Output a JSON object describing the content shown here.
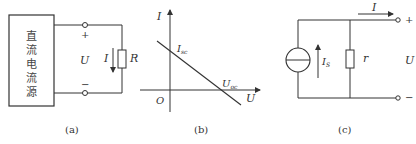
{
  "figure_a": {
    "caption": "(a)",
    "source_box_chars": [
      "直",
      "流",
      "电",
      "流",
      "源"
    ],
    "plus_label": "+",
    "minus_label": "−",
    "voltage_label": "U",
    "current_label": "I",
    "resistor_label": "R"
  },
  "figure_b": {
    "caption": "(b)",
    "y_axis_label": "I",
    "x_axis_label": "U",
    "origin_label": "O",
    "y_intercept_label": "I",
    "y_intercept_sub": "sc",
    "x_intercept_label": "U",
    "x_intercept_sub": "oc"
  },
  "figure_c": {
    "caption": "(c)",
    "output_current_label": "I",
    "source_current_label": "I",
    "source_current_sub": "S",
    "resistor_label": "r",
    "voltage_label": "U",
    "plus_label": "+",
    "minus_label": "−"
  },
  "colors": {
    "line": "#333333",
    "background": "#ffffff"
  }
}
